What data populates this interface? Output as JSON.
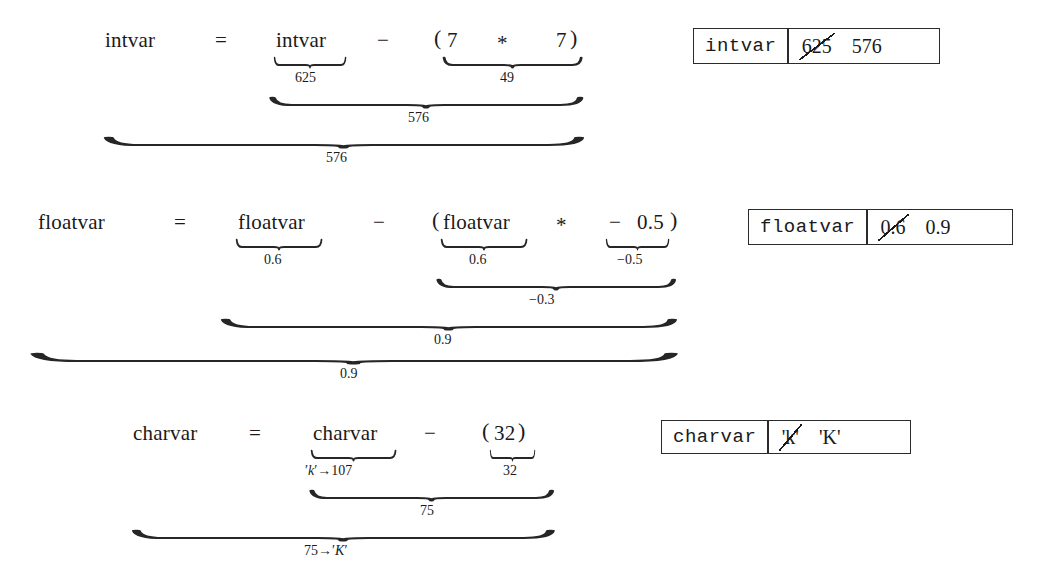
{
  "document": {
    "kind": "expression-evaluation-trace",
    "background": "#ffffff",
    "ink": "#1a1a1a"
  },
  "rows": [
    {
      "id": "intvar",
      "lhs": "intvar",
      "equals": "=",
      "operand_a": "intvar",
      "operator": "−",
      "open_paren": "(",
      "inner_left": "7",
      "inner_op": "*",
      "inner_right": "7",
      "close_paren": ")",
      "brace_a_label": "625",
      "brace_b_label": "49",
      "brace_rhs_label": "576",
      "brace_total_label": "576",
      "box": {
        "name": "intvar",
        "old_value": "625",
        "new_value": "576"
      }
    },
    {
      "id": "floatvar",
      "lhs": "floatvar",
      "equals": "=",
      "operand_a": "floatvar",
      "operator": "−",
      "open_paren": "(",
      "inner_left": "floatvar",
      "inner_op": "*",
      "inner_right_sign": "−",
      "inner_right_num": "0.5",
      "close_paren": ")",
      "brace_a_label": "0.6",
      "brace_b_label": "0.6",
      "brace_c_label": "−0.5",
      "brace_inner_label": "−0.3",
      "brace_rhs_label": "0.9",
      "brace_total_label": "0.9",
      "box": {
        "name": "floatvar",
        "old_value": "0.6",
        "new_value": "0.9"
      }
    },
    {
      "id": "charvar",
      "lhs": "charvar",
      "equals": "=",
      "operand_a": "charvar",
      "operator": "−",
      "open_paren": "(",
      "inner_left": "32",
      "close_paren": ")",
      "brace_a_label_prime1": "′",
      "brace_a_label_k": "k",
      "brace_a_label_prime2": "′",
      "brace_a_label_arrow": "→107",
      "brace_b_label": "32",
      "brace_rhs_label": "75",
      "brace_total_label_num": "75",
      "brace_total_label_arrow": "→",
      "brace_total_label_prime1": "′",
      "brace_total_label_char": "K",
      "brace_total_label_prime2": "′",
      "box": {
        "name": "charvar",
        "old_value": "'k'",
        "new_value": "'K'"
      }
    }
  ]
}
